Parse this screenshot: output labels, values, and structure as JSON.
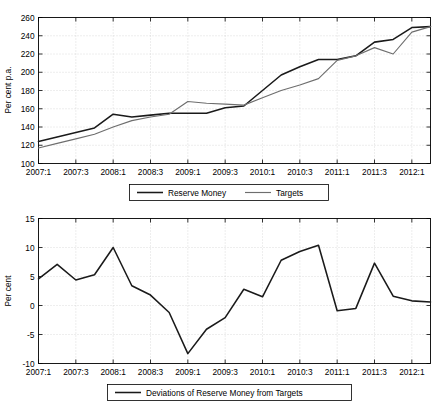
{
  "chart_data": [
    {
      "id": "reserve-money-levels",
      "type": "line",
      "title": "",
      "xlabel": "",
      "ylabel": "Per cent p.a.",
      "ylim": [
        100,
        260
      ],
      "yticks": [
        100,
        120,
        140,
        160,
        180,
        200,
        220,
        240,
        260
      ],
      "xticklabels": [
        "2007:1",
        "2007:3",
        "2008:1",
        "2008:3",
        "2009:1",
        "2009:3",
        "2010:1",
        "2010:3",
        "2011:1",
        "2011:3",
        "2012:1"
      ],
      "x": [
        "2007:1",
        "2007:2",
        "2007:3",
        "2007:4",
        "2008:1",
        "2008:2",
        "2008:3",
        "2008:4",
        "2009:1",
        "2009:2",
        "2009:3",
        "2009:4",
        "2010:1",
        "2010:2",
        "2010:3",
        "2010:4",
        "2011:1",
        "2011:2",
        "2011:3",
        "2011:4",
        "2012:1",
        "2012:2"
      ],
      "grid": true,
      "legend_position": "below",
      "series": [
        {
          "name": "Reserve Money",
          "color": "#1a1a1a",
          "values": [
            124,
            129,
            134,
            139,
            154,
            151,
            153,
            155,
            155,
            155,
            161,
            163,
            180,
            197,
            206,
            214,
            214,
            218,
            233,
            236,
            249,
            250
          ]
        },
        {
          "name": "Targets",
          "color": "#6e6e6e",
          "values": [
            117,
            122,
            127,
            132,
            140,
            147,
            151,
            154,
            168,
            166,
            165,
            164,
            172,
            180,
            186,
            193,
            213,
            218,
            227,
            220,
            244,
            250
          ]
        }
      ]
    },
    {
      "id": "reserve-money-deviations",
      "type": "line",
      "title": "",
      "xlabel": "",
      "ylabel": "Per cent",
      "ylim": [
        -10,
        15
      ],
      "yticks": [
        -10,
        -5,
        0,
        5,
        10,
        15
      ],
      "xticklabels": [
        "2007:1",
        "2007:3",
        "2008:1",
        "2008:3",
        "2009:1",
        "2009:3",
        "2010:1",
        "2010:3",
        "2011:1",
        "2011:3",
        "2012:1"
      ],
      "x": [
        "2007:1",
        "2007:2",
        "2007:3",
        "2007:4",
        "2008:1",
        "2008:2",
        "2008:3",
        "2008:4",
        "2009:1",
        "2009:2",
        "2009:3",
        "2009:4",
        "2010:1",
        "2010:2",
        "2010:3",
        "2010:4",
        "2011:1",
        "2011:2",
        "2011:3",
        "2011:4",
        "2012:1",
        "2012:2"
      ],
      "grid": true,
      "legend_position": "below",
      "series": [
        {
          "name": "Deviations of Reserve Money from Targets",
          "color": "#1a1a1a",
          "values": [
            4.6,
            7.1,
            4.4,
            5.3,
            10.0,
            3.4,
            1.8,
            -1.2,
            -8.3,
            -4.1,
            -2.1,
            2.8,
            1.5,
            7.8,
            9.3,
            10.4,
            -0.9,
            -0.5,
            7.3,
            1.6,
            0.8,
            0.6
          ]
        }
      ]
    }
  ],
  "top_chart": {
    "ylabel": "Per cent p.a.",
    "yticks": [
      "260",
      "240",
      "220",
      "200",
      "180",
      "160",
      "140",
      "120",
      "100"
    ],
    "xticks": [
      "2007:1",
      "2007:3",
      "2008:1",
      "2008:3",
      "2009:1",
      "2009:3",
      "2010:1",
      "2010:3",
      "2011:1",
      "2011:3",
      "2012:1"
    ],
    "legend": [
      {
        "label": "Reserve Money",
        "color": "#1a1a1a"
      },
      {
        "label": "Targets",
        "color": "#6e6e6e"
      }
    ]
  },
  "bottom_chart": {
    "ylabel": "Per cent",
    "yticks": [
      "15",
      "10",
      "5",
      "0",
      "-5",
      "-10"
    ],
    "xticks": [
      "2007:1",
      "2007:3",
      "2008:1",
      "2008:3",
      "2009:1",
      "2009:3",
      "2010:1",
      "2010:3",
      "2011:1",
      "2011:3",
      "2012:1"
    ],
    "legend": [
      {
        "label": "Deviations of Reserve Money from Targets",
        "color": "#1a1a1a"
      }
    ]
  }
}
